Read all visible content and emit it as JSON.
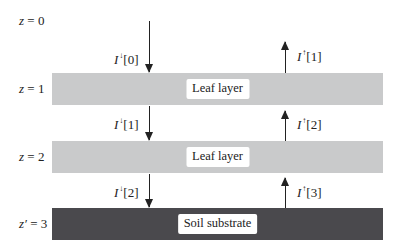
{
  "diagram": {
    "title": "",
    "depth_labels": [
      {
        "var": "z",
        "eq": " = 0"
      },
      {
        "var": "z",
        "eq": " = 1"
      },
      {
        "var": "z",
        "eq": " = 2"
      },
      {
        "var": "z′",
        "eq": " = 3"
      }
    ],
    "layers": [
      {
        "label": "Leaf layer",
        "type": "leaf",
        "color": "#c9cacb"
      },
      {
        "label": "Leaf layer",
        "type": "leaf",
        "color": "#c9cacb"
      },
      {
        "label": "Soil substrate",
        "type": "soil",
        "color": "#4a494d"
      }
    ],
    "downward_fluxes": [
      {
        "symbol": "I",
        "dir": "↓",
        "index": "[0]"
      },
      {
        "symbol": "I",
        "dir": "↓",
        "index": "[1]"
      },
      {
        "symbol": "I",
        "dir": "↓",
        "index": "[2]"
      }
    ],
    "upward_fluxes": [
      {
        "symbol": "I",
        "dir": "↑",
        "index": "[1]"
      },
      {
        "symbol": "I",
        "dir": "↑",
        "index": "[2]"
      },
      {
        "symbol": "I",
        "dir": "↑",
        "index": "[3]"
      }
    ]
  }
}
